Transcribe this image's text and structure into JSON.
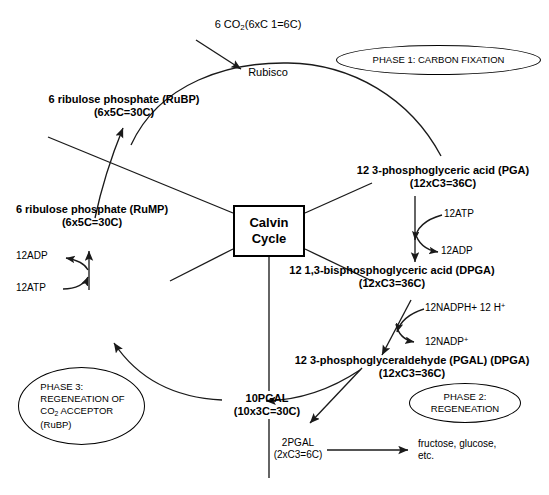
{
  "diagram": {
    "title": "Calvin Cycle",
    "center_box": {
      "line1": "Calvin",
      "line2": "Cycle"
    },
    "inputs": {
      "co2_label": "6 CO2(6xC 1=6C)",
      "co2_prefix": "6 CO",
      "co2_sub": "2",
      "co2_suffix": "(6xC 1=6C)",
      "enzyme": "Rubisco"
    },
    "phases": [
      {
        "name": "phase-1",
        "text": "PHASE 1: CARBON FIXATION"
      },
      {
        "name": "phase-2",
        "line1": "PHASE 2:",
        "line2": "REGENEATION"
      },
      {
        "name": "phase-3",
        "line1": "PHASE 3:",
        "line2": "REGENEATION OF",
        "line3_prefix": "CO",
        "line3_sub": "2",
        "line3_suffix": " ACCEPTOR",
        "line4": "(RuBP)"
      }
    ],
    "metabolites": [
      {
        "name": "rubp",
        "line1": "6 ribulose phosphate (RuBP)",
        "line2": "(6x5C=30C)"
      },
      {
        "name": "rump",
        "line1": "6 ribulose phosphate (RuMP)",
        "line2": "(6x5C=30C)"
      },
      {
        "name": "pga",
        "line1": "12 3-phosphoglyceric acid (PGA)",
        "line2": "(12xC3=36C)"
      },
      {
        "name": "dpga",
        "line1": "12 1,3-bisphosphoglyceric acid (DPGA)",
        "line2": "(12xC3=36C)"
      },
      {
        "name": "pgal",
        "line1": "12 3-phosphoglyceraldehyde (PGAL) (DPGA)",
        "line2": "(12xC3=36C)"
      },
      {
        "name": "pgal-10",
        "line1": "10PGAL",
        "line2": "(10x3C=30C)"
      },
      {
        "name": "pgal-2",
        "line1": "2PGAL",
        "line2": "(2xC3=6C)"
      }
    ],
    "cofactors": [
      {
        "name": "atp-in-pga",
        "text": "12ATP"
      },
      {
        "name": "adp-out-pga",
        "text": "12ADP"
      },
      {
        "name": "nadph-in",
        "prefix": "12NADPH+ 12 H",
        "sup": "+"
      },
      {
        "name": "nadp-out",
        "prefix": "12NADP",
        "sup": "+"
      },
      {
        "name": "adp-out-rump",
        "text": "12ADP"
      },
      {
        "name": "atp-in-rump",
        "text": "12ATP"
      }
    ],
    "products": {
      "text_line1": "fructose, glucose,",
      "text_line2": "etc."
    },
    "colors": {
      "stroke": "#1a1a1a",
      "background": "#ffffff",
      "text": "#000000"
    }
  }
}
